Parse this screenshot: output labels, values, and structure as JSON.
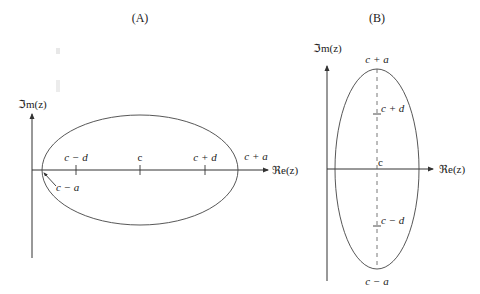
{
  "panel_a": {
    "title": "(A)",
    "y_axis_label": "ℑm(z)",
    "x_axis_label": "ℜe(z)",
    "ticks": {
      "c_minus_d": "c − d",
      "c": "c",
      "c_plus_d": "c + d"
    },
    "c_plus_a": "c + a",
    "c_minus_a": "c − a",
    "orientation": "horizontal major axis"
  },
  "panel_b": {
    "title": "(B)",
    "y_axis_label": "ℑm(z)",
    "x_axis_label": "ℜe(z)",
    "ticks": {
      "c_plus_a": "c + a",
      "c_plus_d": "c + d",
      "c": "c",
      "c_minus_d": "c − d",
      "c_minus_a": "c − a"
    },
    "orientation": "vertical major axis"
  },
  "colors": {
    "stroke": "#333333",
    "text": "#222222",
    "background": "#ffffff"
  }
}
